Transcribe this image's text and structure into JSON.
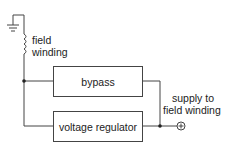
{
  "diagram": {
    "type": "block-diagram",
    "nodes": {
      "field_winding": {
        "line1": "field",
        "line2": "winding"
      },
      "bypass": {
        "label": "bypass"
      },
      "voltage_regulator": {
        "label": "voltage regulator"
      },
      "supply": {
        "line1": "supply to",
        "line2": "field winding"
      }
    },
    "symbols": {
      "ground": "ground-symbol",
      "coil": "inductor-coil",
      "terminal": "positive-terminal"
    },
    "colors": {
      "line": "#444444",
      "text": "#222222",
      "background": "#ffffff"
    }
  }
}
